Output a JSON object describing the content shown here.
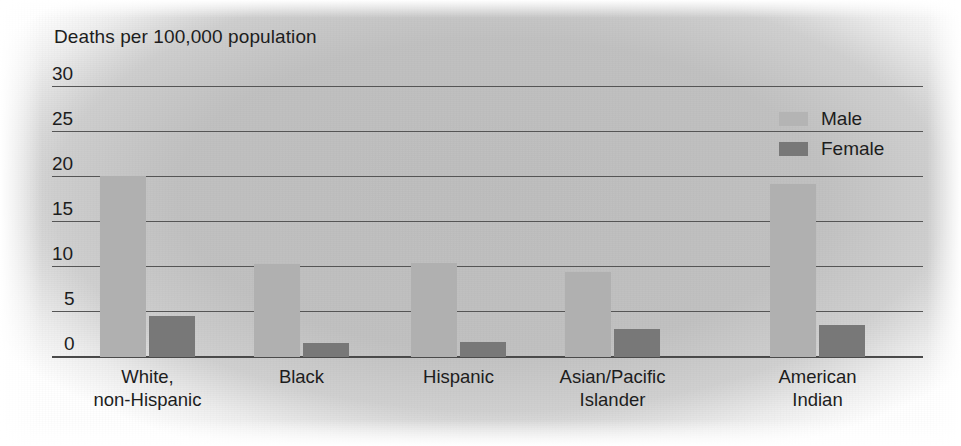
{
  "chart_data": {
    "type": "bar",
    "title": "Deaths per 100,000 population",
    "xlabel": "",
    "ylabel": "Deaths per 100,000 population",
    "ylim": [
      0,
      30
    ],
    "yticks": [
      0,
      5,
      10,
      15,
      20,
      25,
      30
    ],
    "ytick_labels": [
      "0",
      "5",
      "10",
      "15",
      "20",
      "25",
      "30"
    ],
    "grid": true,
    "legend_position": "top-right",
    "categories": [
      "White,\nnon-Hispanic",
      "Black",
      "Hispanic",
      "Asian/Pacific\nIslander",
      "American\nIndian"
    ],
    "series": [
      {
        "name": "Male",
        "color": "#b0b0b0",
        "values": [
          20.1,
          10.3,
          10.4,
          9.4,
          19.2
        ]
      },
      {
        "name": "Female",
        "color": "#787878",
        "values": [
          4.6,
          1.6,
          1.7,
          3.1,
          3.6
        ]
      }
    ]
  },
  "legend": {
    "items": [
      {
        "label": "Male",
        "swatch": "male"
      },
      {
        "label": "Female",
        "swatch": "female"
      }
    ]
  }
}
